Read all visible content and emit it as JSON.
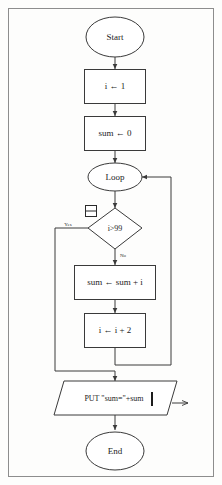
{
  "diagram": {
    "type": "flowchart",
    "border_color": "#8d8d8d",
    "stroke_color": "#3a3a3a",
    "background_color": "#fdfdfc",
    "nodes": [
      {
        "id": "start",
        "shape": "terminator",
        "label": "Start"
      },
      {
        "id": "init_i",
        "shape": "process",
        "label": "i ← 1"
      },
      {
        "id": "init_sum",
        "shape": "process",
        "label": "sum ← 0"
      },
      {
        "id": "loop",
        "shape": "connector",
        "label": "Loop"
      },
      {
        "id": "test",
        "shape": "decision",
        "label": "i>99"
      },
      {
        "id": "accum",
        "shape": "process",
        "label": "sum ← sum + i"
      },
      {
        "id": "incr",
        "shape": "process",
        "label": "i ← i + 2"
      },
      {
        "id": "output",
        "shape": "parallelogram",
        "label": "PUT \"sum=\"+sum"
      },
      {
        "id": "end",
        "shape": "terminator",
        "label": "End"
      }
    ],
    "edge_labels": {
      "yes": "Yes",
      "no": "No"
    },
    "annotations": {
      "selection_handle": "note-icon"
    }
  }
}
